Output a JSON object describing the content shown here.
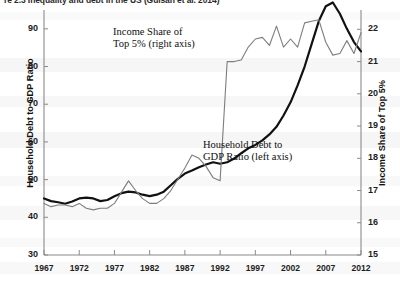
{
  "title": "re 2.3   Inequality and debt in the US (Guisan et al. 2014)",
  "axes": {
    "left": {
      "label": "Household Debt to GDP Ratio",
      "ticks": [
        30,
        40,
        50,
        60,
        70,
        80,
        90
      ],
      "min": 30,
      "max": 95
    },
    "right": {
      "label": "Income Share of Top 5%",
      "ticks": [
        15,
        16,
        17,
        18,
        19,
        20,
        21,
        22
      ],
      "min": 15,
      "max": 22.6
    },
    "x": {
      "ticks": [
        1967,
        1972,
        1977,
        1982,
        1987,
        1992,
        1997,
        2002,
        2007,
        2012
      ],
      "min": 1967,
      "max": 2012
    }
  },
  "annotations": {
    "income": {
      "line1": "Income Share of",
      "line2": "Top 5% (right axis)"
    },
    "debt": {
      "line1": "Household Debt to",
      "line2": "GDP Ratio (left axis)"
    }
  },
  "colors": {
    "debt_line": "#111111",
    "income_line": "#7d7d7d",
    "axis": "#8a8a8a",
    "text": "#1d1d1d"
  },
  "chart_data": {
    "type": "line",
    "title": "Inequality and debt in the US",
    "xlabel": "",
    "ylabel": "Household Debt to GDP Ratio",
    "y2label": "Income Share of Top 5%",
    "xlim": [
      1967,
      2012
    ],
    "ylim": [
      30,
      95
    ],
    "y2lim": [
      15,
      22.6
    ],
    "grid": false,
    "legend": "in-plot annotations",
    "x": [
      1967,
      1968,
      1969,
      1970,
      1971,
      1972,
      1973,
      1974,
      1975,
      1976,
      1977,
      1978,
      1979,
      1980,
      1981,
      1982,
      1983,
      1984,
      1985,
      1986,
      1987,
      1988,
      1989,
      1990,
      1991,
      1992,
      1993,
      1994,
      1995,
      1996,
      1997,
      1998,
      1999,
      2000,
      2001,
      2002,
      2003,
      2004,
      2005,
      2006,
      2007,
      2008,
      2009,
      2010,
      2011,
      2012
    ],
    "series": [
      {
        "name": "Household Debt to GDP Ratio (left axis)",
        "axis": "left",
        "color": "#111111",
        "width": 2.2,
        "values": [
          45.0,
          44.3,
          44.0,
          43.6,
          44.2,
          45.0,
          45.2,
          45.0,
          44.3,
          44.6,
          45.6,
          46.4,
          46.8,
          46.6,
          46.0,
          45.6,
          46.0,
          46.8,
          48.5,
          50.2,
          51.6,
          52.4,
          53.3,
          54.0,
          54.6,
          54.2,
          54.6,
          55.6,
          57.0,
          58.3,
          59.2,
          60.4,
          62.0,
          64.0,
          67.0,
          70.5,
          75.0,
          80.0,
          86.0,
          92.0,
          96.0,
          97.0,
          94.0,
          90.0,
          86.5,
          84.0
        ]
      },
      {
        "name": "Income Share of Top 5% (right axis)",
        "axis": "right",
        "color": "#7d7d7d",
        "width": 1.1,
        "values": [
          16.6,
          16.5,
          16.55,
          16.55,
          16.5,
          16.6,
          16.45,
          16.4,
          16.45,
          16.45,
          16.6,
          16.95,
          17.3,
          17.0,
          16.75,
          16.6,
          16.6,
          16.75,
          17.0,
          17.35,
          17.7,
          18.1,
          18.0,
          17.75,
          17.4,
          17.3,
          21.0,
          21.0,
          21.05,
          21.45,
          21.7,
          21.75,
          21.5,
          22.1,
          21.45,
          21.7,
          21.45,
          22.2,
          22.25,
          22.3,
          21.6,
          21.2,
          21.25,
          21.65,
          21.25,
          21.9
        ]
      }
    ]
  }
}
